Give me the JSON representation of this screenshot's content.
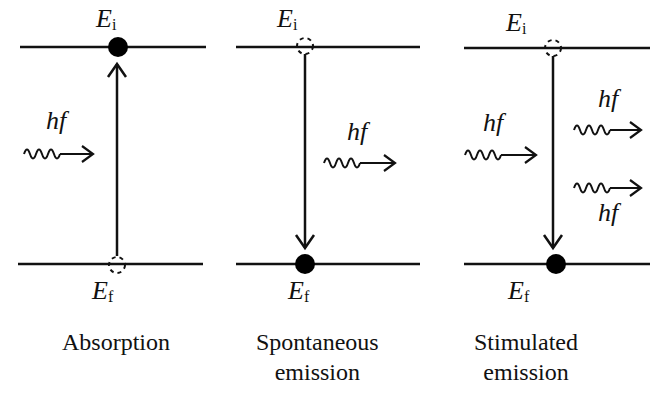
{
  "diagram": {
    "title": "",
    "panels": [
      {
        "id": "absorption",
        "caption_lines": [
          "Absorption"
        ],
        "upper_level": {
          "symbol": "E",
          "subscript": "i",
          "state": "filled"
        },
        "lower_level": {
          "symbol": "E",
          "subscript": "f",
          "state": "empty"
        },
        "transition": "upward",
        "photons": [
          {
            "label": "hf",
            "direction": "incoming"
          }
        ]
      },
      {
        "id": "spontaneous-emission",
        "caption_lines": [
          "Spontaneous",
          "emission"
        ],
        "upper_level": {
          "symbol": "E",
          "subscript": "i",
          "state": "empty"
        },
        "lower_level": {
          "symbol": "E",
          "subscript": "f",
          "state": "filled"
        },
        "transition": "downward",
        "photons": [
          {
            "label": "hf",
            "direction": "outgoing"
          }
        ]
      },
      {
        "id": "stimulated-emission",
        "caption_lines": [
          "Stimulated",
          "emission"
        ],
        "upper_level": {
          "symbol": "E",
          "subscript": "i",
          "state": "empty"
        },
        "lower_level": {
          "symbol": "E",
          "subscript": "f",
          "state": "filled"
        },
        "transition": "downward",
        "photons": [
          {
            "label": "hf",
            "direction": "incoming"
          },
          {
            "label": "hf",
            "direction": "outgoing"
          },
          {
            "label": "hf",
            "direction": "outgoing"
          }
        ]
      }
    ],
    "colors": {
      "line": "#111111",
      "background": "#ffffff"
    }
  }
}
